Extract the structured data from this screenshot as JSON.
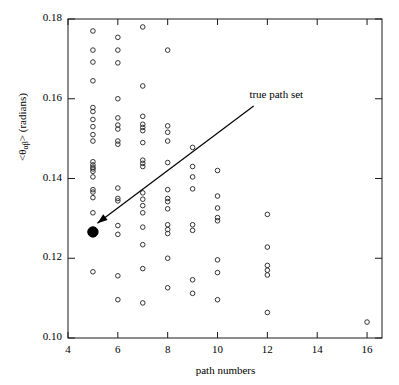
{
  "chart_data": {
    "type": "scatter",
    "title": "",
    "xlabel": "path numbers",
    "ylabel": "<θαβ> (radians)",
    "ylabel_main": "<θ",
    "ylabel_sub": "αβ",
    "ylabel_tail": "> (radians)",
    "xlim": [
      4,
      16.6
    ],
    "ylim": [
      0.1,
      0.18
    ],
    "xticks": [
      4,
      6,
      8,
      10,
      12,
      14,
      16
    ],
    "xticklabels": [
      "4",
      "6",
      "8",
      "10",
      "12",
      "14",
      "16"
    ],
    "yticks": [
      0.1,
      0.12,
      0.14,
      0.16,
      0.18
    ],
    "yticklabels": [
      "0.10",
      "0.12",
      "0.14",
      "0.16",
      "0.18"
    ],
    "grid": false,
    "legend": null,
    "marker": "open-circle",
    "marker_color": "#000000",
    "series": [
      {
        "name": "candidate path sets",
        "marker": "open-circle",
        "points": [
          [
            5,
            0.177
          ],
          [
            5,
            0.1722
          ],
          [
            5,
            0.1692
          ],
          [
            5,
            0.1645
          ],
          [
            5,
            0.1578
          ],
          [
            5,
            0.1568
          ],
          [
            5,
            0.1548
          ],
          [
            5,
            0.153
          ],
          [
            5,
            0.151
          ],
          [
            5,
            0.1494
          ],
          [
            5,
            0.1442
          ],
          [
            5,
            0.1434
          ],
          [
            5,
            0.1428
          ],
          [
            5,
            0.1424
          ],
          [
            5,
            0.1418
          ],
          [
            5,
            0.1404
          ],
          [
            5,
            0.1372
          ],
          [
            5,
            0.1366
          ],
          [
            5,
            0.1352
          ],
          [
            5,
            0.1314
          ],
          [
            5,
            0.1166
          ],
          [
            6,
            0.1754
          ],
          [
            6,
            0.1722
          ],
          [
            6,
            0.169
          ],
          [
            6,
            0.16
          ],
          [
            6,
            0.1552
          ],
          [
            6,
            0.1534
          ],
          [
            6,
            0.1524
          ],
          [
            6,
            0.1494
          ],
          [
            6,
            0.1486
          ],
          [
            6,
            0.1376
          ],
          [
            6,
            0.135
          ],
          [
            6,
            0.1344
          ],
          [
            6,
            0.1282
          ],
          [
            6,
            0.126
          ],
          [
            6,
            0.1156
          ],
          [
            6,
            0.1096
          ],
          [
            7,
            0.178
          ],
          [
            7,
            0.1632
          ],
          [
            7,
            0.1556
          ],
          [
            7,
            0.1536
          ],
          [
            7,
            0.1528
          ],
          [
            7,
            0.152
          ],
          [
            7,
            0.149
          ],
          [
            7,
            0.1446
          ],
          [
            7,
            0.1438
          ],
          [
            7,
            0.143
          ],
          [
            7,
            0.1364
          ],
          [
            7,
            0.1348
          ],
          [
            7,
            0.1332
          ],
          [
            7,
            0.1314
          ],
          [
            7,
            0.1278
          ],
          [
            7,
            0.1234
          ],
          [
            7,
            0.1174
          ],
          [
            7,
            0.1088
          ],
          [
            8,
            0.1722
          ],
          [
            8,
            0.1532
          ],
          [
            8,
            0.1516
          ],
          [
            8,
            0.1494
          ],
          [
            8,
            0.144
          ],
          [
            8,
            0.1372
          ],
          [
            8,
            0.135
          ],
          [
            8,
            0.1342
          ],
          [
            8,
            0.1324
          ],
          [
            8,
            0.1284
          ],
          [
            8,
            0.1272
          ],
          [
            8,
            0.1262
          ],
          [
            8,
            0.12
          ],
          [
            8,
            0.1126
          ],
          [
            9,
            0.1478
          ],
          [
            9,
            0.143
          ],
          [
            9,
            0.1404
          ],
          [
            9,
            0.1374
          ],
          [
            9,
            0.1284
          ],
          [
            9,
            0.127
          ],
          [
            9,
            0.1146
          ],
          [
            9,
            0.1112
          ],
          [
            10,
            0.142
          ],
          [
            10,
            0.1356
          ],
          [
            10,
            0.1326
          ],
          [
            10,
            0.1302
          ],
          [
            10,
            0.1294
          ],
          [
            10,
            0.1196
          ],
          [
            10,
            0.1164
          ],
          [
            10,
            0.1096
          ],
          [
            12,
            0.131
          ],
          [
            12,
            0.1228
          ],
          [
            12,
            0.1182
          ],
          [
            12,
            0.117
          ],
          [
            12,
            0.1158
          ],
          [
            12,
            0.1064
          ],
          [
            16,
            0.104
          ]
        ]
      },
      {
        "name": "true path set",
        "marker": "filled-circle",
        "points": [
          [
            5,
            0.1266
          ]
        ]
      }
    ],
    "annotations": [
      {
        "text": "true path set",
        "text_x": 11.6,
        "text_y": 0.1608,
        "arrow_from_x": 11.45,
        "arrow_from_y": 0.1582,
        "arrow_to_x": 5.18,
        "arrow_to_y": 0.1288
      }
    ]
  }
}
